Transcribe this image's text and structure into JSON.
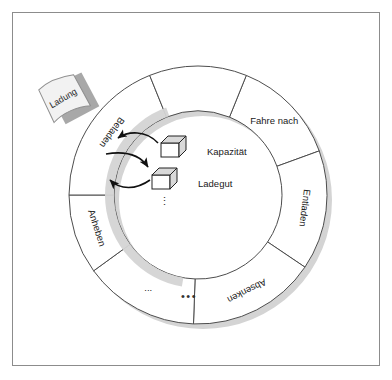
{
  "figure": {
    "frame": {
      "border_color": "#8c8c8c",
      "background": "#ffffff"
    }
  },
  "colors": {
    "ring_fill": "#ffffff",
    "ring_stroke": "#4d4d4d",
    "shadow_fill": "#d4d4d4",
    "text": "#1a1a1a",
    "note_fill": "#f2f2f2",
    "note_shadow": "#a8a8a8",
    "cube_fill": "#ffffff",
    "cube_top_fill": "#d9d9d9",
    "arrow_stroke": "#111111"
  },
  "ring": {
    "center_x": 198,
    "center_y": 195,
    "outer_radius": 129,
    "inner_radius": 84,
    "segments": [
      {
        "id": "fahre-nach",
        "label": "Fahre nach",
        "start_angle": -68,
        "end_angle": -20,
        "label_angle": -44,
        "label_radius": 106,
        "rotated": false
      },
      {
        "id": "entladen",
        "label": "Entladen",
        "start_angle": -20,
        "end_angle": 34,
        "label_angle": 7,
        "label_radius": 107,
        "rotated": true
      },
      {
        "id": "absenken",
        "label": "Absenken",
        "start_angle": 34,
        "end_angle": 92,
        "label_angle": 63,
        "label_radius": 107,
        "rotated": true
      },
      {
        "id": "ellipsis",
        "label": "...",
        "start_angle": 92,
        "end_angle": 144,
        "label_angle": 118,
        "label_radius": 106,
        "rotated": false
      },
      {
        "id": "anheben",
        "label": "Anheben",
        "start_angle": 144,
        "end_angle": 180,
        "label_angle": 162,
        "label_radius": 107,
        "rotated": true
      },
      {
        "id": "beladen",
        "label": "Beladen",
        "start_angle": 180,
        "end_angle": 248,
        "label_angle": 216,
        "label_radius": 107,
        "rotated": true
      },
      {
        "id": "top-left-gap",
        "label": "",
        "start_angle": 248,
        "end_angle": 292,
        "label_angle": 270,
        "label_radius": 107,
        "rotated": false
      }
    ]
  },
  "center_items": [
    {
      "id": "kapazitaet",
      "label": "Kapazität",
      "cube_x": 161,
      "cube_y": 136,
      "text_x": 189,
      "text_y": 150
    },
    {
      "id": "ladegut",
      "label": "Ladegut",
      "cube_x": 152,
      "cube_y": 168,
      "text_x": 180,
      "text_y": 182
    }
  ],
  "center_ellipsis": {
    "label": "⋮",
    "x": 165,
    "y": 205
  },
  "bottom_ellipsis": {
    "label": "•••",
    "x": 189,
    "y": 300
  },
  "note": {
    "id": "ladung-note",
    "label": "Ladung",
    "x": 38,
    "y": 88,
    "rotation": -22
  },
  "arrows": [
    {
      "id": "arrow-kapazitaet-to-beladen",
      "direction": "to-segment"
    },
    {
      "id": "arrow-beladen-to-ladegut",
      "direction": "to-center"
    },
    {
      "id": "arrow-ladegut-to-beladen",
      "direction": "to-segment"
    }
  ]
}
